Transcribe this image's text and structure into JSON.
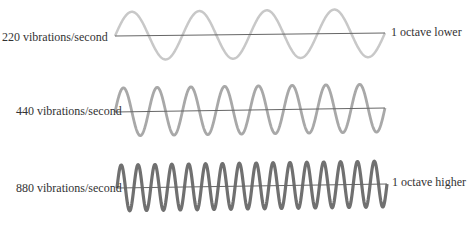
{
  "diagram": {
    "rows": [
      {
        "left_label": "220 vibrations/second",
        "right_label": "1 octave lower",
        "cycles": 4,
        "color": "#c8c8c8",
        "stroke_width": 2.5
      },
      {
        "left_label": "440 vibrations/second",
        "right_label": "",
        "cycles": 8,
        "color": "#a8a8a8",
        "stroke_width": 2.8
      },
      {
        "left_label": "880 vibrations/second",
        "right_label": "1 octave higher",
        "cycles": 16,
        "color": "#707070",
        "stroke_width": 3.2
      }
    ],
    "axis_color": "#666666"
  }
}
